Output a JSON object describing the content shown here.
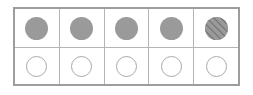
{
  "figure": {
    "background_color": "#ffffff",
    "table": {
      "border_color": "#9d9d9d",
      "gridline_color": "#b4b4b4",
      "columns": 5,
      "rows": 2
    },
    "tokens": {
      "filled_color": "#9a9a9a",
      "hatch_line_color": "#6e6e6e",
      "empty_outline_color": "#a8a8a8",
      "empty_fill_color": "#ffffff"
    }
  },
  "rows": [
    {
      "name": "top-row",
      "label": "filled tokens row",
      "cells": [
        {
          "id": "r1c1",
          "state": "filled",
          "label": "solid circle"
        },
        {
          "id": "r1c2",
          "state": "filled",
          "label": "solid circle"
        },
        {
          "id": "r1c3",
          "state": "filled",
          "label": "solid circle"
        },
        {
          "id": "r1c4",
          "state": "filled",
          "label": "solid circle"
        },
        {
          "id": "r1c5",
          "state": "hatched",
          "label": "hatched circle"
        }
      ]
    },
    {
      "name": "bottom-row",
      "label": "empty tokens row",
      "cells": [
        {
          "id": "r2c1",
          "state": "empty",
          "label": "empty circle"
        },
        {
          "id": "r2c2",
          "state": "empty",
          "label": "empty circle"
        },
        {
          "id": "r2c3",
          "state": "empty",
          "label": "empty circle"
        },
        {
          "id": "r2c4",
          "state": "empty",
          "label": "empty circle"
        },
        {
          "id": "r2c5",
          "state": "empty",
          "label": "empty circle"
        }
      ]
    }
  ]
}
